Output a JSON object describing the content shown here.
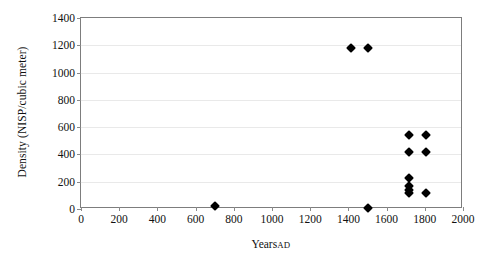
{
  "chart_data": {
    "type": "scatter",
    "title": "",
    "xlabel": "Years AD",
    "xlabel_main": "Years",
    "xlabel_suffix": "AD",
    "ylabel": "Density (NISP/cubic meter)",
    "xlim": [
      0,
      2000
    ],
    "ylim": [
      0,
      1400
    ],
    "xticks": [
      0,
      200,
      400,
      600,
      800,
      1000,
      1200,
      1400,
      1600,
      1800,
      2000
    ],
    "yticks": [
      0,
      200,
      400,
      600,
      800,
      1000,
      1200,
      1400
    ],
    "xtick_labels": [
      "0",
      "200",
      "400",
      "600",
      "800",
      "1000",
      "1200",
      "1400",
      "1600",
      "1800",
      "2000"
    ],
    "ytick_labels": [
      "0",
      "200",
      "400",
      "600",
      "800",
      "1000",
      "1200",
      "1400"
    ],
    "grid": "horizontal",
    "legend": "none",
    "marker": "diamond",
    "marker_color": "#000000",
    "series": [
      {
        "name": "Density",
        "points": [
          {
            "x": 700,
            "y": 20
          },
          {
            "x": 1415,
            "y": 1180
          },
          {
            "x": 1505,
            "y": 1180
          },
          {
            "x": 1500,
            "y": 10
          },
          {
            "x": 1715,
            "y": 545
          },
          {
            "x": 1715,
            "y": 420
          },
          {
            "x": 1805,
            "y": 545
          },
          {
            "x": 1805,
            "y": 420
          },
          {
            "x": 1715,
            "y": 230
          },
          {
            "x": 1715,
            "y": 165
          },
          {
            "x": 1715,
            "y": 140
          },
          {
            "x": 1715,
            "y": 120
          },
          {
            "x": 1805,
            "y": 120
          }
        ]
      }
    ]
  },
  "colors": {
    "marker": "#000000",
    "gridline": "#e9e9e9",
    "axis": "#7d7d7d",
    "text": "#111111",
    "background": "#ffffff"
  }
}
